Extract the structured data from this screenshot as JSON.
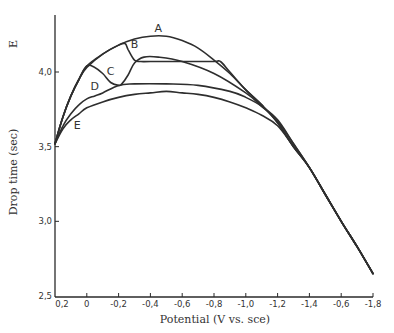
{
  "chart_data": {
    "type": "line",
    "title": "",
    "xlabel": "Potential (V vs. sce)",
    "ylabel": "Drop time (sec)",
    "corner_label": "E",
    "x_ticks": [
      {
        "value": 0.2,
        "label": "0,2"
      },
      {
        "value": 0.0,
        "label": "0"
      },
      {
        "value": -0.2,
        "label": "-0,2"
      },
      {
        "value": -0.4,
        "label": "-0,4"
      },
      {
        "value": -0.6,
        "label": "-0,6"
      },
      {
        "value": -0.8,
        "label": "-0,8"
      },
      {
        "value": -1.0,
        "label": "-1,0"
      },
      {
        "value": -1.2,
        "label": "-1,2"
      },
      {
        "value": -1.4,
        "label": "-1,4"
      },
      {
        "value": -1.6,
        "label": "-0,6"
      },
      {
        "value": -1.8,
        "label": "-1,8"
      }
    ],
    "y_ticks": [
      {
        "value": 2.5,
        "label": "2,5"
      },
      {
        "value": 3.0,
        "label": "3,0"
      },
      {
        "value": 3.5,
        "label": "3,5"
      },
      {
        "value": 4.0,
        "label": "4,0"
      }
    ],
    "xlim": [
      0.2,
      -1.8
    ],
    "ylim": [
      2.5,
      4.3
    ],
    "grid": false,
    "legend": "inline curve labels",
    "series": [
      {
        "name": "A",
        "label_pos": [
          -0.45,
          4.27
        ],
        "x": [
          0.2,
          0.15,
          0.1,
          0.05,
          0.0,
          -0.1,
          -0.2,
          -0.3,
          -0.4,
          -0.5,
          -0.6,
          -0.7,
          -0.8,
          -0.9,
          -1.0,
          -1.1,
          -1.2,
          -1.3,
          -1.4,
          -1.5,
          -1.6,
          -1.7,
          -1.8
        ],
        "values": [
          3.52,
          3.7,
          3.84,
          3.95,
          4.03,
          4.12,
          4.18,
          4.22,
          4.24,
          4.24,
          4.21,
          4.16,
          4.08,
          3.99,
          3.88,
          3.78,
          3.66,
          3.5,
          3.36,
          3.18,
          3.0,
          2.83,
          2.65
        ]
      },
      {
        "name": "B",
        "label_pos": [
          -0.3,
          4.16
        ],
        "x": [
          0.2,
          0.15,
          0.1,
          0.05,
          0.0,
          -0.1,
          -0.2,
          -0.24,
          -0.26,
          -0.3,
          -0.34,
          -0.4,
          -0.6,
          -0.8,
          -0.84,
          -0.9,
          -1.0,
          -1.1,
          -1.2,
          -1.3,
          -1.4,
          -1.5,
          -1.6,
          -1.7,
          -1.8
        ],
        "values": [
          3.52,
          3.7,
          3.84,
          3.95,
          4.04,
          4.12,
          4.18,
          4.19,
          4.15,
          4.08,
          4.07,
          4.07,
          4.07,
          4.07,
          4.07,
          4.0,
          3.88,
          3.78,
          3.66,
          3.5,
          3.36,
          3.18,
          3.0,
          2.83,
          2.65
        ]
      },
      {
        "name": "C",
        "label_pos": [
          -0.15,
          3.98
        ],
        "x": [
          0.2,
          0.15,
          0.1,
          0.05,
          0.0,
          -0.05,
          -0.1,
          -0.15,
          -0.2,
          -0.22,
          -0.26,
          -0.3,
          -0.36,
          -0.45,
          -0.6,
          -0.8,
          -1.0,
          -1.1,
          -1.2,
          -1.3,
          -1.4,
          -1.5,
          -1.6,
          -1.7,
          -1.8
        ],
        "values": [
          3.52,
          3.7,
          3.84,
          3.95,
          4.04,
          4.03,
          3.99,
          3.93,
          3.91,
          3.92,
          3.98,
          4.06,
          4.1,
          4.1,
          4.07,
          3.99,
          3.86,
          3.77,
          3.67,
          3.52,
          3.36,
          3.18,
          3.0,
          2.83,
          2.65
        ]
      },
      {
        "name": "D",
        "label_pos": [
          -0.05,
          3.88
        ],
        "x": [
          0.2,
          0.15,
          0.1,
          0.05,
          0.0,
          -0.05,
          -0.1,
          -0.2,
          -0.3,
          -0.5,
          -0.7,
          -0.9,
          -1.0,
          -1.1,
          -1.2,
          -1.3,
          -1.4,
          -1.5,
          -1.6,
          -1.7,
          -1.8
        ],
        "values": [
          3.52,
          3.64,
          3.72,
          3.78,
          3.82,
          3.84,
          3.86,
          3.91,
          3.92,
          3.92,
          3.91,
          3.87,
          3.83,
          3.77,
          3.68,
          3.52,
          3.36,
          3.18,
          3.0,
          2.83,
          2.65
        ]
      },
      {
        "name": "E",
        "label_pos": [
          0.06,
          3.62
        ],
        "x": [
          0.2,
          0.15,
          0.1,
          0.05,
          0.0,
          -0.1,
          -0.2,
          -0.3,
          -0.4,
          -0.5,
          -0.6,
          -0.7,
          -0.8,
          -0.9,
          -1.0,
          -1.1,
          -1.2,
          -1.3,
          -1.4,
          -1.5,
          -1.6,
          -1.7,
          -1.8
        ],
        "values": [
          3.52,
          3.62,
          3.68,
          3.72,
          3.76,
          3.8,
          3.83,
          3.85,
          3.86,
          3.87,
          3.86,
          3.85,
          3.83,
          3.8,
          3.76,
          3.71,
          3.64,
          3.5,
          3.36,
          3.18,
          3.0,
          2.83,
          2.65
        ]
      }
    ]
  },
  "layout": {
    "x_px_at": {
      "v0": 0.2,
      "px0": 55,
      "v1": -1.8,
      "px1": 373
    },
    "y_px_at": {
      "v0": 2.5,
      "px0": 296,
      "v1": 4.0,
      "px1": 72
    }
  }
}
